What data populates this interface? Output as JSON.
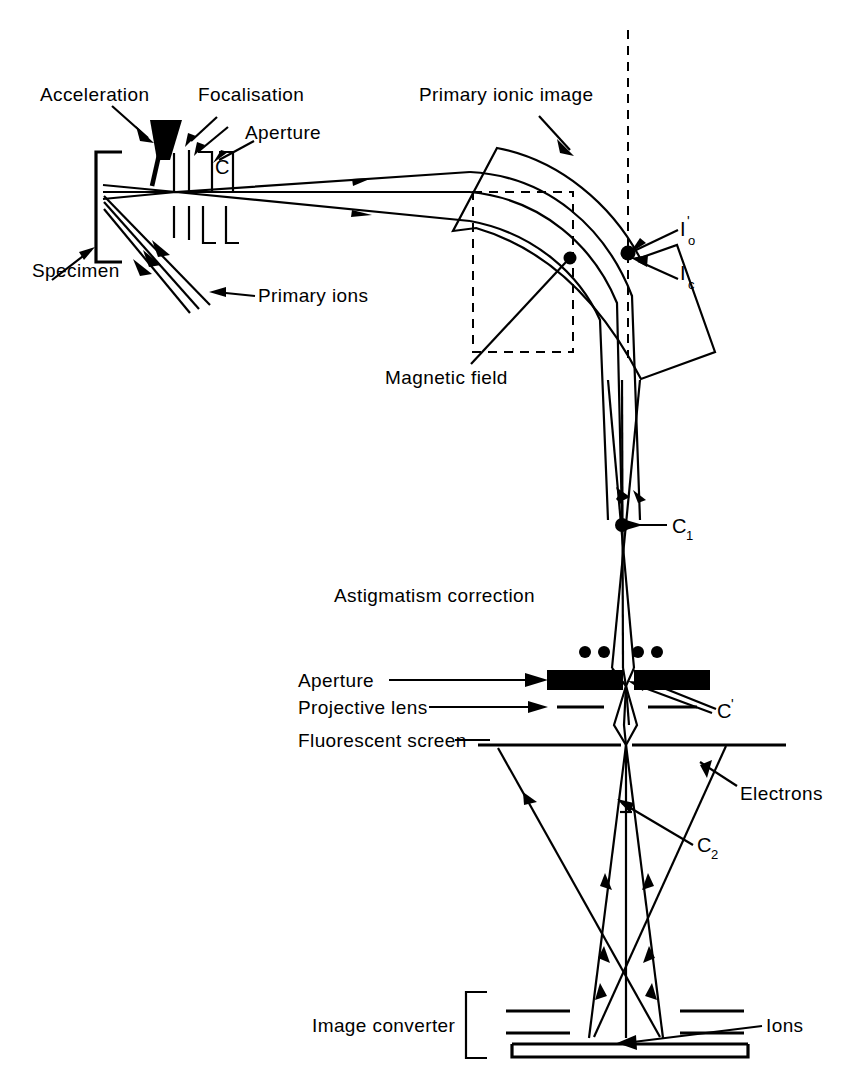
{
  "figure": {
    "background_color": "#ffffff",
    "line_color": "#000000",
    "width": 859,
    "height": 1092
  },
  "labels": {
    "acceleration": "Acceleration",
    "focalisation": "Focalisation",
    "aperture_top": "Aperture",
    "specimen": "Specimen",
    "primary_ions": "Primary ions",
    "primary_ionic_image": "Primary ionic image",
    "magnetic_field": "Magnetic field",
    "astigmatism_correction": "Astigmatism correction",
    "aperture_mid": "Aperture",
    "projective_lens": "Projective lens",
    "fluorescent_screen": "Fluorescent screen",
    "electrons": "Electrons",
    "image_converter": "Image converter",
    "ions": "Ions"
  },
  "symbols": {
    "c_top": "C",
    "i_o_base": "I",
    "i_o_prime": "'",
    "i_o_sub": "o",
    "i_c_base": "I",
    "i_c_sub": "c",
    "c1_base": "C",
    "c1_sub": "1",
    "c_prime_base": "C",
    "c_prime_mark": "'",
    "c2_base": "C",
    "c2_sub": "2"
  },
  "components": {
    "specimen_holder": "bracket-left-open",
    "acceleration_electrode": "filled-triangle-wedge",
    "focalisation_electrodes": "three-pairs-of-plates",
    "magnet_sector": "curved-quadrilateral-prism",
    "dashed_reference_box": "dashed-rectangle",
    "optic_axis": "vertical-dashed-line",
    "astigmatism_dots": 4,
    "aperture_plates": "two-thick-black-bars-with-comb-teeth",
    "projective_lens_plates": "four-short-horizontal-dashes",
    "fluorescent_screen_plate": "horizontal-line-split-at-axis",
    "image_converter_plates": "four-short-bars-plus-base-plate",
    "image_converter_bracket": "square-bracket-left"
  },
  "beam_counts": {
    "primary_ion_rays": 3,
    "secondary_ion_rays": 3,
    "electron_rays": 2,
    "ion_rays_converter": 2
  }
}
